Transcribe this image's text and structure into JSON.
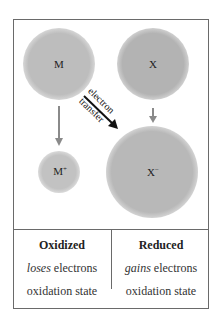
{
  "diagram": {
    "circles": [
      {
        "id": "M",
        "label": "M",
        "superscript": "",
        "cx": 59,
        "cy": 64,
        "r": 36,
        "color": "#bdbdbd"
      },
      {
        "id": "X",
        "label": "X",
        "superscript": "",
        "cx": 153,
        "cy": 64,
        "r": 36,
        "color": "#b3b3b3"
      },
      {
        "id": "M+",
        "label": "M",
        "superscript": "+",
        "cx": 59,
        "cy": 172,
        "r": 21,
        "color": "#c2c2c2"
      },
      {
        "id": "X-",
        "label": "X",
        "superscript": "−",
        "cx": 152,
        "cy": 172,
        "r": 46,
        "color": "#b8b8b8"
      }
    ],
    "arrows": [
      {
        "id": "M-to-Mplus",
        "color": "#8a8a8a"
      },
      {
        "id": "X-to-Xminus",
        "color": "#8a8a8a"
      },
      {
        "id": "electron-transfer",
        "color": "#111111"
      }
    ],
    "transfer_label": {
      "line1": "electron",
      "line2": "transfer"
    }
  },
  "table": {
    "left": {
      "title": "Oxidized",
      "line1_em": "loses",
      "line1_rest": " electrons",
      "line2": "oxidation state"
    },
    "right": {
      "title": "Reduced",
      "line1_em": "gains",
      "line1_rest": " electrons",
      "line2": "oxidation state"
    }
  }
}
